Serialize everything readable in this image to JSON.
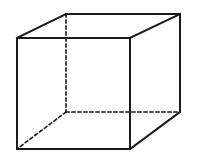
{
  "diagram": {
    "title": "",
    "shape": "cube",
    "stroke_color": "#1a1a1a",
    "background": "#ffffff",
    "front_face": {
      "x1": 17,
      "y1": 38,
      "x2": 130,
      "y2": 149
    },
    "back_face": {
      "x1": 66,
      "y1": 14,
      "x2": 180,
      "y2": 112
    },
    "visible_edges": [
      [
        17,
        38,
        130,
        38
      ],
      [
        130,
        38,
        130,
        149
      ],
      [
        130,
        149,
        17,
        149
      ],
      [
        17,
        149,
        17,
        38
      ],
      [
        17,
        38,
        66,
        14
      ],
      [
        66,
        14,
        180,
        14
      ],
      [
        130,
        38,
        180,
        14
      ],
      [
        180,
        14,
        180,
        112
      ],
      [
        130,
        149,
        180,
        112
      ]
    ],
    "hidden_edges": [
      [
        66,
        14,
        66,
        112
      ],
      [
        66,
        112,
        180,
        112
      ],
      [
        66,
        112,
        17,
        149
      ]
    ]
  }
}
